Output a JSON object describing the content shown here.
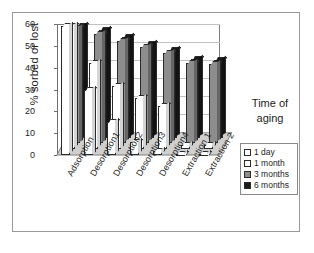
{
  "chart_data": {
    "type": "bar",
    "title": "",
    "xlabel": "",
    "ylabel": "% sorbed or lost",
    "ylim": [
      0,
      60
    ],
    "yticks": [
      0,
      10,
      20,
      30,
      40,
      50,
      60
    ],
    "grid": true,
    "legend_position": "right",
    "legend_title": "Time of aging",
    "categories": [
      "Adsorption",
      "Desorption1",
      "Desorption2",
      "Desorption3",
      "Desorption4",
      "Extraction 1",
      "Extraction 2"
    ],
    "series": [
      {
        "name": "1 day",
        "color": "#ffffff",
        "values": [
          59,
          30,
          15,
          6,
          2,
          0.5,
          0.5
        ]
      },
      {
        "name": "1 month",
        "color": "#ffffff",
        "values": [
          60,
          42,
          31,
          25,
          21,
          2,
          2
        ]
      },
      {
        "name": "3 months",
        "color": "#8d8d8d",
        "values": [
          60,
          57,
          53,
          50,
          47,
          42,
          41
        ]
      },
      {
        "name": "6 months",
        "color": "#1a1a1a",
        "values": [
          62,
          60,
          56,
          52,
          49,
          44,
          43
        ]
      }
    ]
  },
  "legend": {
    "title_line1": "Time of",
    "title_line2": "aging",
    "items": [
      {
        "label": "1 day",
        "color": "#ffffff"
      },
      {
        "label": "1 month",
        "color": "#ffffff"
      },
      {
        "label": "3 months",
        "color": "#8d8d8d"
      },
      {
        "label": "6 months",
        "color": "#1a1a1a"
      }
    ]
  },
  "axis": {
    "y_title": "% sorbed or lost",
    "y_tick_labels": [
      "0",
      "10",
      "20",
      "30",
      "40",
      "50",
      "60"
    ]
  }
}
